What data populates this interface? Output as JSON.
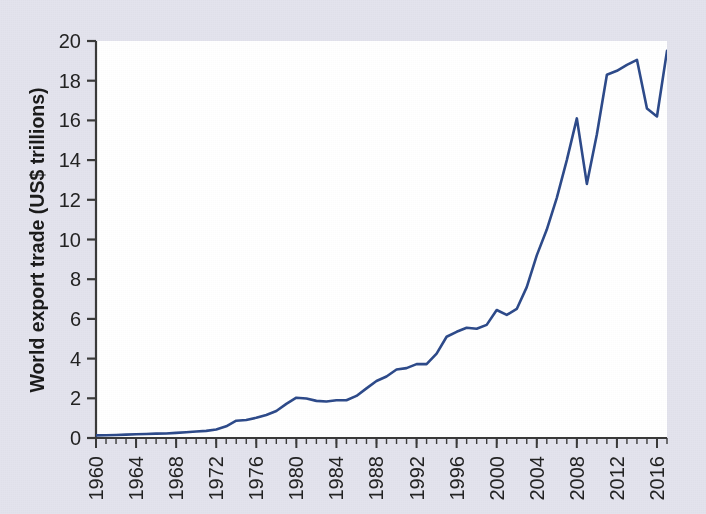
{
  "figure": {
    "background_color": "#e3e3ed",
    "plot_background_color": "#ffffff",
    "axis_color": "#3a3a3a",
    "line_color": "#2d4a8a"
  },
  "chart_data": {
    "type": "line",
    "title": "",
    "xlabel": "",
    "ylabel": "World export trade (US$ trillions)",
    "xlim": [
      1960,
      2017
    ],
    "ylim": [
      0,
      20
    ],
    "ytick_labels": [
      "0",
      "2",
      "4",
      "6",
      "8",
      "10",
      "12",
      "14",
      "16",
      "18",
      "20"
    ],
    "ytick_values": [
      0,
      2,
      4,
      6,
      8,
      10,
      12,
      14,
      16,
      18,
      20
    ],
    "xtick_labels": [
      "1960",
      "1964",
      "1968",
      "1972",
      "1976",
      "1980",
      "1984",
      "1988",
      "1992",
      "1996",
      "2000",
      "2004",
      "2008",
      "2012",
      "2016"
    ],
    "xtick_values": [
      1960,
      1964,
      1968,
      1972,
      1976,
      1980,
      1984,
      1988,
      1992,
      1996,
      2000,
      2004,
      2008,
      2012,
      2016
    ],
    "minor_xtick_interval": 1,
    "grid": false,
    "legend": false,
    "series": [
      {
        "name": "World export trade",
        "color": "#2d4a8a",
        "x": [
          1960,
          1961,
          1962,
          1963,
          1964,
          1965,
          1966,
          1967,
          1968,
          1969,
          1970,
          1971,
          1972,
          1973,
          1974,
          1975,
          1976,
          1977,
          1978,
          1979,
          1980,
          1981,
          1982,
          1983,
          1984,
          1985,
          1986,
          1987,
          1988,
          1989,
          1990,
          1991,
          1992,
          1993,
          1994,
          1995,
          1996,
          1997,
          1998,
          1999,
          2000,
          2001,
          2002,
          2003,
          2004,
          2005,
          2006,
          2007,
          2008,
          2009,
          2010,
          2011,
          2012,
          2013,
          2014,
          2015,
          2016,
          2017
        ],
        "values": [
          0.13,
          0.14,
          0.15,
          0.17,
          0.19,
          0.2,
          0.22,
          0.23,
          0.26,
          0.29,
          0.33,
          0.36,
          0.43,
          0.59,
          0.87,
          0.91,
          1.02,
          1.16,
          1.36,
          1.72,
          2.03,
          1.99,
          1.87,
          1.84,
          1.9,
          1.9,
          2.12,
          2.5,
          2.87,
          3.1,
          3.45,
          3.52,
          3.72,
          3.72,
          4.25,
          5.1,
          5.35,
          5.55,
          5.5,
          5.7,
          6.45,
          6.2,
          6.5,
          7.6,
          9.2,
          10.5,
          12.1,
          14.0,
          16.1,
          12.8,
          15.3,
          18.3,
          18.5,
          18.8,
          19.05,
          16.6,
          16.2,
          19.5
        ]
      }
    ]
  },
  "annotations": {
    "peak_2008_value": "16.1",
    "trough_2009_value": "12.8",
    "peak_2014_value": "19.05",
    "trough_2016_value": "16.2",
    "final_2017_value": "19.5"
  }
}
